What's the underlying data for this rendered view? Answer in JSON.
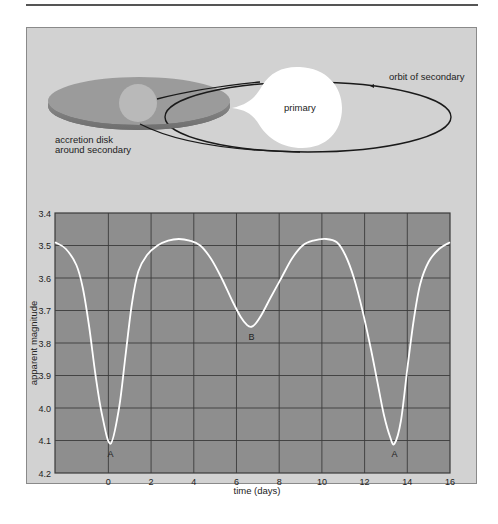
{
  "diagram": {
    "labels": {
      "orbit": "orbit of secondary",
      "primary": "primary",
      "disk_line1": "accretion disk",
      "disk_line2": "around secondary"
    }
  },
  "chart_data": {
    "type": "line",
    "title": "",
    "xlabel": "time (days)",
    "ylabel": "apparent magnitude",
    "xlim": [
      -2.5,
      16
    ],
    "ylim": [
      3.4,
      4.2
    ],
    "y_inverted": true,
    "grid": true,
    "x_ticks": [
      "0",
      "2",
      "4",
      "6",
      "8",
      "10",
      "12",
      "14",
      "16"
    ],
    "y_ticks": [
      "3.4",
      "3.5",
      "3.6",
      "3.7",
      "3.8",
      "3.9",
      "4.0",
      "4.1",
      "4.2"
    ],
    "series": [
      {
        "name": "light curve",
        "color": "#ffffff",
        "x": [
          -2.5,
          -2.0,
          -1.5,
          -1.2,
          -0.9,
          -0.6,
          -0.3,
          0.1,
          0.5,
          0.8,
          1.1,
          1.4,
          1.8,
          2.3,
          2.8,
          3.3,
          3.8,
          4.3,
          4.8,
          5.3,
          5.8,
          6.2,
          6.5,
          6.7,
          6.9,
          7.2,
          7.6,
          8.1,
          8.6,
          9.1,
          9.6,
          10.2,
          10.7,
          11.1,
          11.5,
          11.9,
          12.3,
          12.6,
          12.9,
          13.2,
          13.4,
          13.7,
          14.0,
          14.3,
          14.6,
          15.0,
          15.5,
          16.0
        ],
        "values": [
          3.49,
          3.51,
          3.56,
          3.63,
          3.75,
          3.9,
          4.02,
          4.11,
          4.0,
          3.84,
          3.68,
          3.58,
          3.53,
          3.5,
          3.485,
          3.48,
          3.485,
          3.5,
          3.54,
          3.6,
          3.67,
          3.72,
          3.745,
          3.75,
          3.74,
          3.71,
          3.66,
          3.6,
          3.54,
          3.5,
          3.485,
          3.48,
          3.49,
          3.53,
          3.6,
          3.7,
          3.82,
          3.92,
          4.02,
          4.09,
          4.11,
          4.04,
          3.88,
          3.73,
          3.62,
          3.55,
          3.51,
          3.49
        ]
      }
    ],
    "annotations": [
      {
        "text": "A",
        "x": 0.1,
        "y": 4.11
      },
      {
        "text": "B",
        "x": 6.7,
        "y": 3.75
      },
      {
        "text": "A",
        "x": 13.4,
        "y": 4.11
      }
    ]
  }
}
